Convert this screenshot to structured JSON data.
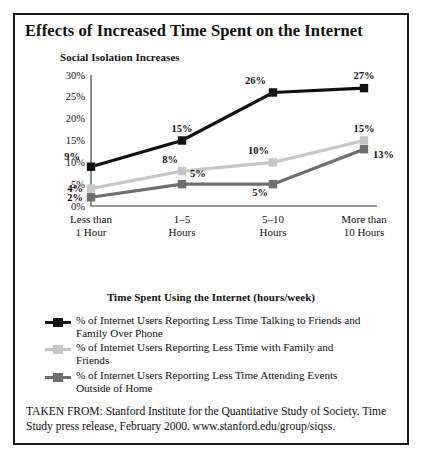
{
  "figure": {
    "title": "Effects of Increased Time Spent on the Internet",
    "plot_heading": "Social Isolation Increases",
    "source_note": "TAKEN FROM: Stanford Institute for the Quantitative Study of Society. Time Study press release, February 2000. www.stanford.edu/group/siqss."
  },
  "chart_data": {
    "type": "line",
    "title": "Social Isolation Increases",
    "xlabel": "Time Spent Using the Internet (hours/week)",
    "ylabel": "",
    "ylim": [
      0,
      30
    ],
    "yticks": [
      0,
      5,
      10,
      15,
      20,
      25,
      30
    ],
    "ytick_labels": [
      "0%",
      "5%",
      "10%",
      "15%",
      "20%",
      "25%",
      "30%"
    ],
    "grid": false,
    "legend_position": "bottom",
    "categories": [
      "Less than 1 Hour",
      "1–5 Hours",
      "5–10 Hours",
      "More than 10 Hours"
    ],
    "category_lines": [
      [
        "Less than",
        "1 Hour"
      ],
      [
        "1–5",
        "Hours"
      ],
      [
        "5–10",
        "Hours"
      ],
      [
        "More than",
        "10 Hours"
      ]
    ],
    "series": [
      {
        "name": "% of Internet Users Reporting Less Time Talking to Friends and Family Over Phone",
        "name_lines": [
          "% of Internet Users Reporting Less Time Talking to Friends and",
          "Family Over Phone"
        ],
        "color": "#111111",
        "values": [
          9,
          15,
          26,
          27
        ],
        "value_labels": [
          "9%",
          "15%",
          "26%",
          "27%"
        ]
      },
      {
        "name": "% of Internet Users Reporting Less Time with Family and Friends",
        "name_lines": [
          "% of Internet Users Reporting Less Time with Family and",
          "Friends"
        ],
        "color": "#c6c6c6",
        "values": [
          4,
          8,
          10,
          15
        ],
        "value_labels": [
          "4%",
          "8%",
          "10%",
          "15%"
        ]
      },
      {
        "name": "% of Internet Users Reporting Less Time Attending Events Outside of Home",
        "name_lines": [
          "% of Internet Users Reporting Less Time Attending Events",
          "Outside of Home"
        ],
        "color": "#6e6e6e",
        "values": [
          2,
          5,
          5,
          13
        ],
        "value_labels": [
          "2%",
          "5%",
          "5%",
          "13%"
        ]
      }
    ]
  }
}
